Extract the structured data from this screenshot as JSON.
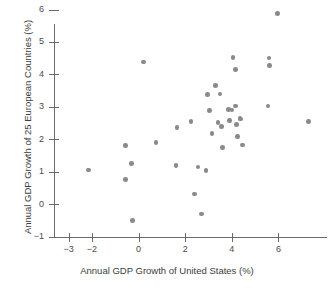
{
  "chart_data": {
    "type": "scatter",
    "title": "",
    "xlabel": "Annual GDP Growth of United States (%)",
    "ylabel": "Annual GDP Growth of 25 European Countries (%)",
    "xlim": [
      -3,
      7.6
    ],
    "ylim": [
      -1,
      6.3
    ],
    "xticks": [
      -3,
      -2,
      0,
      2,
      4,
      6
    ],
    "xticklabels": [
      "−3",
      "−2",
      "0",
      "2",
      "4",
      "6"
    ],
    "yticks": [
      -1,
      0,
      1,
      2,
      3,
      4,
      5,
      6
    ],
    "yticklabels": [
      "−1",
      "0",
      "1",
      "2",
      "3",
      "4",
      "5",
      "6"
    ],
    "grid": false,
    "legend": null,
    "marker": {
      "shape": "circle",
      "color": "#8a8a8a",
      "size": 4.6
    },
    "axis_color": "#6b6b6b",
    "points": [
      {
        "x": -2.15,
        "y": 1.05
      },
      {
        "x": -0.55,
        "y": 1.8
      },
      {
        "x": -0.55,
        "y": 0.77
      },
      {
        "x": -0.3,
        "y": 1.25
      },
      {
        "x": -0.25,
        "y": -0.5
      },
      {
        "x": 0.22,
        "y": 4.38
      },
      {
        "x": 0.75,
        "y": 1.9
      },
      {
        "x": 1.6,
        "y": 1.2
      },
      {
        "x": 1.65,
        "y": 2.37
      },
      {
        "x": 2.25,
        "y": 2.55
      },
      {
        "x": 2.4,
        "y": 0.32
      },
      {
        "x": 2.55,
        "y": 1.15
      },
      {
        "x": 2.7,
        "y": -0.3
      },
      {
        "x": 2.9,
        "y": 1.03
      },
      {
        "x": 2.95,
        "y": 3.38
      },
      {
        "x": 3.05,
        "y": 2.88
      },
      {
        "x": 3.15,
        "y": 2.18
      },
      {
        "x": 3.3,
        "y": 3.65
      },
      {
        "x": 3.4,
        "y": 2.52
      },
      {
        "x": 3.5,
        "y": 3.4
      },
      {
        "x": 3.55,
        "y": 2.4
      },
      {
        "x": 3.6,
        "y": 1.75
      },
      {
        "x": 3.85,
        "y": 2.92
      },
      {
        "x": 3.9,
        "y": 2.58
      },
      {
        "x": 4.0,
        "y": 2.9
      },
      {
        "x": 4.05,
        "y": 4.52
      },
      {
        "x": 4.15,
        "y": 3.02
      },
      {
        "x": 4.15,
        "y": 4.15
      },
      {
        "x": 4.2,
        "y": 2.45
      },
      {
        "x": 4.25,
        "y": 2.08
      },
      {
        "x": 4.35,
        "y": 2.65
      },
      {
        "x": 4.4,
        "y": 2.62
      },
      {
        "x": 4.45,
        "y": 1.82
      },
      {
        "x": 5.55,
        "y": 3.03
      },
      {
        "x": 5.6,
        "y": 4.5
      },
      {
        "x": 5.62,
        "y": 4.28
      },
      {
        "x": 5.95,
        "y": 5.88
      },
      {
        "x": 7.3,
        "y": 2.55
      }
    ]
  }
}
